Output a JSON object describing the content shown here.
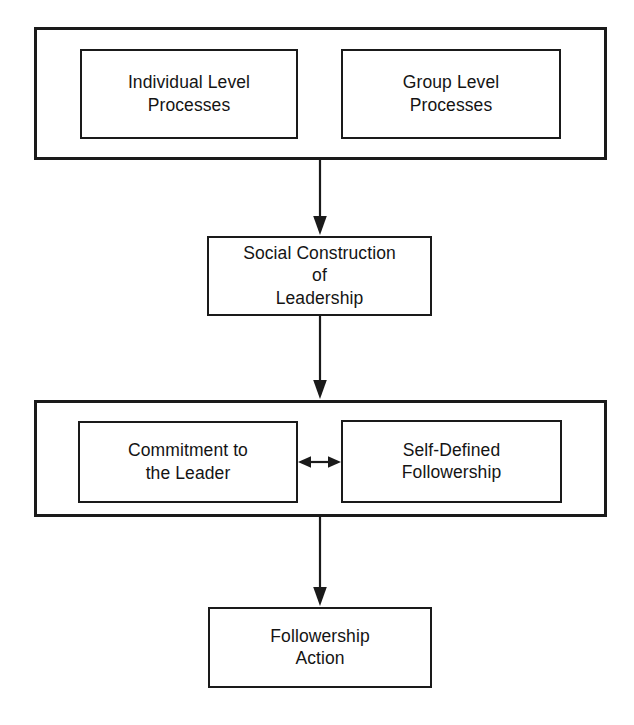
{
  "diagram": {
    "type": "flowchart",
    "orientation": "top-to-bottom",
    "background_color": "#ffffff",
    "line_color": "#1a1a1a",
    "text_color": "#141414",
    "levels": [
      {
        "id": "level-1",
        "kind": "grouped",
        "boxes": [
          {
            "id": "individual-level-processes",
            "label": "Individual Level\nProcesses"
          },
          {
            "id": "group-level-processes",
            "label": "Group Level\nProcesses"
          }
        ]
      },
      {
        "id": "level-2",
        "kind": "single",
        "boxes": [
          {
            "id": "social-construction-of-leadership",
            "label": "Social Construction\nof\nLeadership"
          }
        ]
      },
      {
        "id": "level-3",
        "kind": "grouped",
        "boxes": [
          {
            "id": "commitment-to-the-leader",
            "label": "Commitment to\nthe Leader"
          },
          {
            "id": "self-defined-followership",
            "label": "Self-Defined\nFollowership"
          }
        ]
      },
      {
        "id": "level-4",
        "kind": "single",
        "boxes": [
          {
            "id": "followership-action",
            "label": "Followership\nAction"
          }
        ]
      }
    ],
    "connectors": [
      {
        "id": "arrow-level1-to-level2",
        "from": "level-1",
        "to": "level-2",
        "direction": "down",
        "heads": 1
      },
      {
        "id": "arrow-level2-to-level3",
        "from": "level-2",
        "to": "level-3",
        "direction": "down",
        "heads": 1
      },
      {
        "id": "arrow-commitment-to-followership",
        "from": "commitment-to-the-leader",
        "to": "self-defined-followership",
        "direction": "horizontal",
        "heads": 2
      },
      {
        "id": "arrow-level3-to-level4",
        "from": "level-3",
        "to": "level-4",
        "direction": "down",
        "heads": 1
      }
    ]
  }
}
